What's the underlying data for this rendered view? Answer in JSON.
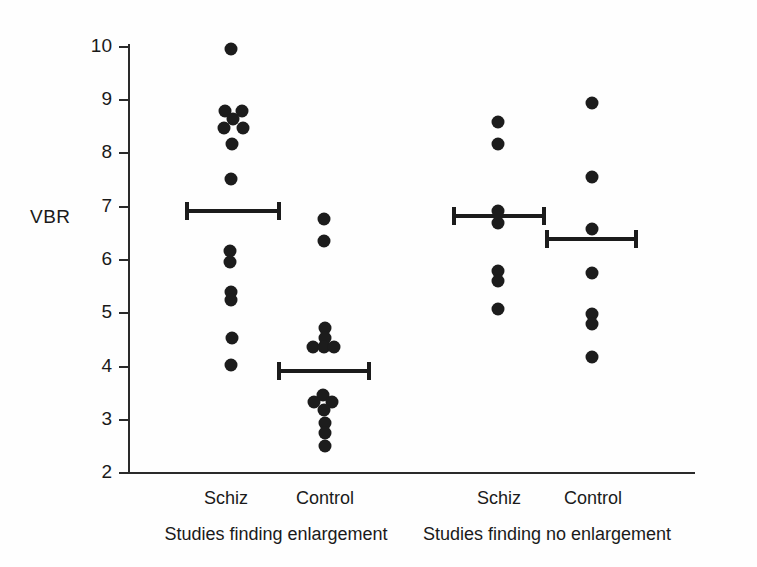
{
  "chart_data": {
    "type": "scatter",
    "title": "",
    "xlabel": "",
    "ylabel": "VBR",
    "ylim": [
      2,
      10
    ],
    "yticks": [
      2,
      3,
      4,
      5,
      6,
      7,
      8,
      9,
      10
    ],
    "ytick_labels": [
      "2",
      "3",
      "4",
      "5",
      "6",
      "7",
      "8",
      "9",
      "10"
    ],
    "grid": false,
    "legend": "none",
    "panels": [
      {
        "label": "Studies finding enlargement",
        "groups": [
          {
            "label": "Schiz",
            "mean": 6.85,
            "values": [
              9.82,
              8.78,
              8.78,
              8.63,
              8.46,
              8.46,
              8.16,
              7.49,
              6.15,
              5.94,
              5.38,
              5.23,
              4.52,
              4.01
            ]
          },
          {
            "label": "Control",
            "mean": 3.92,
            "values": [
              6.73,
              6.32,
              4.73,
              4.54,
              4.37,
              4.35,
              4.33,
              3.45,
              3.31,
              3.31,
              3.17,
              2.93,
              2.74,
              2.5
            ]
          }
        ]
      },
      {
        "label": "Studies finding no enlargement",
        "groups": [
          {
            "label": "Schiz",
            "mean": 6.78,
            "values": [
              8.5,
              8.09,
              6.86,
              6.64,
              5.77,
              5.58,
              5.05
            ]
          },
          {
            "label": "Control",
            "mean": 6.35,
            "values": [
              8.85,
              7.47,
              6.54,
              5.77,
              4.93,
              4.78,
              4.15
            ]
          }
        ]
      }
    ]
  },
  "axis": {
    "y_title": "VBR"
  },
  "points": [
    {
      "name": "p-schiz-enl-1",
      "x": 231,
      "y": 49,
      "value": 9.82
    },
    {
      "name": "p-schiz-enl-2",
      "x": 225,
      "y": 111,
      "value": 8.78
    },
    {
      "name": "p-schiz-enl-3",
      "x": 242,
      "y": 111,
      "value": 8.78
    },
    {
      "name": "p-schiz-enl-4",
      "x": 233,
      "y": 119,
      "value": 8.63
    },
    {
      "name": "p-schiz-enl-5",
      "x": 224,
      "y": 128,
      "value": 8.46
    },
    {
      "name": "p-schiz-enl-6",
      "x": 243,
      "y": 128,
      "value": 8.46
    },
    {
      "name": "p-schiz-enl-7",
      "x": 232,
      "y": 144,
      "value": 8.16
    },
    {
      "name": "p-schiz-enl-8",
      "x": 231,
      "y": 179,
      "value": 7.49
    },
    {
      "name": "p-schiz-enl-9",
      "x": 230,
      "y": 251,
      "value": 6.15
    },
    {
      "name": "p-schiz-enl-10",
      "x": 230,
      "y": 262,
      "value": 5.94
    },
    {
      "name": "p-schiz-enl-11",
      "x": 231,
      "y": 292,
      "value": 5.38
    },
    {
      "name": "p-schiz-enl-12",
      "x": 231,
      "y": 300,
      "value": 5.23
    },
    {
      "name": "p-schiz-enl-13",
      "x": 232,
      "y": 338,
      "value": 4.52
    },
    {
      "name": "p-schiz-enl-14",
      "x": 231,
      "y": 365,
      "value": 4.01
    },
    {
      "name": "p-ctrl-enl-1",
      "x": 324,
      "y": 219,
      "value": 6.73
    },
    {
      "name": "p-ctrl-enl-2",
      "x": 324,
      "y": 241,
      "value": 6.32
    },
    {
      "name": "p-ctrl-enl-3",
      "x": 325,
      "y": 328,
      "value": 4.73
    },
    {
      "name": "p-ctrl-enl-4",
      "x": 325,
      "y": 338,
      "value": 4.54
    },
    {
      "name": "p-ctrl-enl-5",
      "x": 313,
      "y": 347,
      "value": 4.37
    },
    {
      "name": "p-ctrl-enl-6",
      "x": 324,
      "y": 347,
      "value": 4.35
    },
    {
      "name": "p-ctrl-enl-7",
      "x": 334,
      "y": 347,
      "value": 4.33
    },
    {
      "name": "p-ctrl-enl-8",
      "x": 323,
      "y": 395,
      "value": 3.45
    },
    {
      "name": "p-ctrl-enl-9",
      "x": 314,
      "y": 402,
      "value": 3.31
    },
    {
      "name": "p-ctrl-enl-10",
      "x": 332,
      "y": 402,
      "value": 3.31
    },
    {
      "name": "p-ctrl-enl-11",
      "x": 324,
      "y": 410,
      "value": 3.17
    },
    {
      "name": "p-ctrl-enl-12",
      "x": 325,
      "y": 423,
      "value": 2.93
    },
    {
      "name": "p-ctrl-enl-13",
      "x": 325,
      "y": 433,
      "value": 2.74
    },
    {
      "name": "p-ctrl-enl-14",
      "x": 325,
      "y": 446,
      "value": 2.5
    },
    {
      "name": "p-schiz-noenl-1",
      "x": 498,
      "y": 122,
      "value": 8.5
    },
    {
      "name": "p-schiz-noenl-2",
      "x": 498,
      "y": 144,
      "value": 8.09
    },
    {
      "name": "p-schiz-noenl-3",
      "x": 498,
      "y": 211,
      "value": 6.86
    },
    {
      "name": "p-schiz-noenl-4",
      "x": 498,
      "y": 223,
      "value": 6.64
    },
    {
      "name": "p-schiz-noenl-5",
      "x": 498,
      "y": 271,
      "value": 5.77
    },
    {
      "name": "p-schiz-noenl-6",
      "x": 498,
      "y": 281,
      "value": 5.58
    },
    {
      "name": "p-schiz-noenl-7",
      "x": 498,
      "y": 309,
      "value": 5.05
    },
    {
      "name": "p-ctrl-noenl-1",
      "x": 592,
      "y": 103,
      "value": 8.85
    },
    {
      "name": "p-ctrl-noenl-2",
      "x": 592,
      "y": 177,
      "value": 7.47
    },
    {
      "name": "p-ctrl-noenl-3",
      "x": 592,
      "y": 229,
      "value": 6.54
    },
    {
      "name": "p-ctrl-noenl-4",
      "x": 592,
      "y": 273,
      "value": 5.77
    },
    {
      "name": "p-ctrl-noenl-5",
      "x": 592,
      "y": 314,
      "value": 4.93
    },
    {
      "name": "p-ctrl-noenl-6",
      "x": 592,
      "y": 324,
      "value": 4.78
    },
    {
      "name": "p-ctrl-noenl-7",
      "x": 592,
      "y": 357,
      "value": 4.15
    }
  ],
  "mean_bars": [
    {
      "name": "mean-bar-schiz-enlargement",
      "left": 185,
      "width": 96,
      "y": 211,
      "value": 6.85
    },
    {
      "name": "mean-bar-control-enlargement",
      "left": 277,
      "width": 94,
      "y": 371,
      "value": 3.92
    },
    {
      "name": "mean-bar-schiz-no-enlargement",
      "left": 452,
      "width": 94,
      "y": 216,
      "value": 6.78
    },
    {
      "name": "mean-bar-control-no-enlargement",
      "left": 545,
      "width": 93,
      "y": 239,
      "value": 6.35
    }
  ],
  "ticks": [
    {
      "label": "10",
      "y": 46
    },
    {
      "label": "9",
      "y": 99
    },
    {
      "label": "8",
      "y": 152
    },
    {
      "label": "7",
      "y": 206
    },
    {
      "label": "6",
      "y": 259
    },
    {
      "label": "5",
      "y": 312
    },
    {
      "label": "4",
      "y": 366
    },
    {
      "label": "3",
      "y": 419
    },
    {
      "label": "2",
      "y": 472
    }
  ],
  "group_labels": [
    {
      "name": "group-label-schiz-enlargement",
      "text": "Schiz",
      "x": 226,
      "y": 489
    },
    {
      "name": "group-label-control-enlargement",
      "text": "Control",
      "x": 325,
      "y": 489
    },
    {
      "name": "group-label-schiz-no-enlargement",
      "text": "Schiz",
      "x": 499,
      "y": 489
    },
    {
      "name": "group-label-control-no-enlargement",
      "text": "Control",
      "x": 593,
      "y": 489
    }
  ],
  "panel_labels": [
    {
      "name": "panel-label-enlargement",
      "text": "Studies finding enlargement",
      "x": 276,
      "y": 525
    },
    {
      "name": "panel-label-no-enlargement",
      "text": "Studies finding no enlargement",
      "x": 547,
      "y": 525
    }
  ],
  "colors": {
    "dot": "#1c1c1c",
    "axis": "#2a2a2a",
    "text": "#1a1a1a",
    "background": "#fefefe"
  }
}
